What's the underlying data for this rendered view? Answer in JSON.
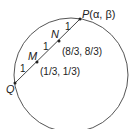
{
  "diagram": {
    "points": {
      "P": {
        "label": "P",
        "coord": "(α, β)"
      },
      "Q": {
        "label": "Q"
      },
      "M": {
        "label": "M",
        "coord": "(1/3, 1/3)"
      },
      "N": {
        "label": "N",
        "coord": "(8/3, 8/3)"
      }
    },
    "segment_labels": [
      "1",
      "1",
      "1"
    ],
    "colors": {
      "stroke": "#555555",
      "text": "#222222"
    }
  }
}
